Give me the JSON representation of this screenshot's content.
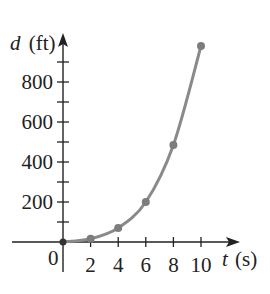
{
  "chart_data": {
    "type": "line",
    "title": "",
    "xlabel": "t (s)",
    "ylabel": "d (ft)",
    "x_var": "t",
    "x_unit": "(s)",
    "y_var": "d",
    "y_unit": "(ft)",
    "origin_label": "0",
    "x": [
      0,
      2,
      4,
      6,
      8,
      10
    ],
    "series": [
      {
        "name": "d(t)",
        "values": [
          0,
          16,
          70,
          200,
          485,
          980
        ],
        "color": "#8a8a8a"
      }
    ],
    "xticks": [
      2,
      4,
      6,
      8,
      10
    ],
    "xtick_labels": [
      "2",
      "4",
      "6",
      "8",
      "10"
    ],
    "yticks_major": [
      200,
      400,
      600,
      800
    ],
    "ytick_labels": [
      "200",
      "400",
      "600",
      "800"
    ],
    "yticks_minor": [
      100,
      300,
      500,
      700,
      900
    ],
    "xlim": [
      0,
      11
    ],
    "ylim": [
      0,
      1000
    ],
    "grid": false,
    "legend": "none",
    "markers": true
  },
  "colors": {
    "axis": "#222222",
    "curve": "#8a8a8a",
    "marker": "#7d7d7d",
    "background": "#ffffff"
  }
}
